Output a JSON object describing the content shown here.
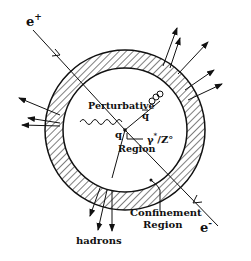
{
  "diagram": {
    "type": "physics-schematic",
    "labels": {
      "positron": "e",
      "positron_sup": "+",
      "electron": "e",
      "electron_sup": "-",
      "perturbative": "Perturbative",
      "region": "Region",
      "quark": "q",
      "antiquark": "q",
      "boson": "γ",
      "boson_sup": "*",
      "boson_rest": "/Z°",
      "confinement_1": "Confinement",
      "confinement_2": "Region",
      "hadrons": "hadrons"
    },
    "colors": {
      "ink": "#111111",
      "background": "#ffffff"
    }
  }
}
